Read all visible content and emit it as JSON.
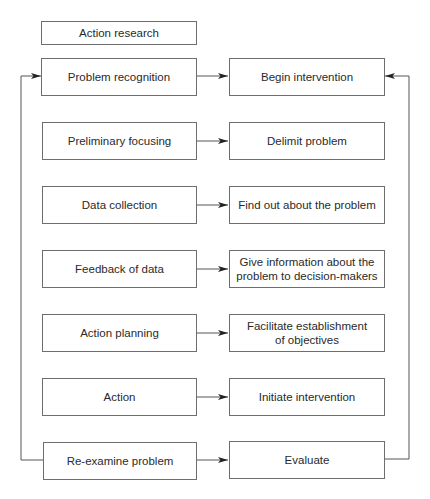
{
  "diagram": {
    "title": "Action research",
    "left_column": [
      {
        "label": "Problem recognition"
      },
      {
        "label": "Preliminary focusing"
      },
      {
        "label": "Data collection"
      },
      {
        "label": "Feedback of data"
      },
      {
        "label": "Action planning"
      },
      {
        "label": "Action"
      },
      {
        "label": "Re-examine problem"
      }
    ],
    "right_column": [
      {
        "label": "Begin intervention"
      },
      {
        "label": "Delimit problem"
      },
      {
        "label": "Find out about the problem"
      },
      {
        "label": "Give information about the\nproblem to decision-makers"
      },
      {
        "label": "Facilitate establishment\nof objectives"
      },
      {
        "label": "Initiate intervention"
      },
      {
        "label": "Evaluate"
      }
    ],
    "feedback_loops": [
      {
        "from": "Re-examine problem",
        "to": "Problem recognition",
        "side": "left"
      },
      {
        "from": "Evaluate",
        "to": "Begin intervention",
        "side": "right"
      }
    ],
    "colors": {
      "line": "#555555",
      "box_border": "#6e6e6e",
      "text": "#2a2a2a"
    }
  }
}
